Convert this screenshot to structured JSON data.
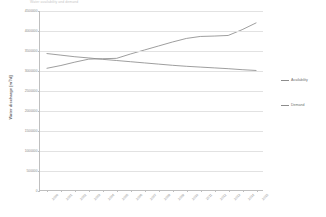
{
  "chart_data": {
    "type": "line",
    "title": "Water availability and demand",
    "xlabel": "",
    "ylabel": "Water discharge [m³/d]",
    "ylim": [
      0,
      4500000
    ],
    "ytick_values": [
      0,
      500000,
      1000000,
      1500000,
      2000000,
      2500000,
      3000000,
      3500000,
      4000000,
      4500000
    ],
    "ytick_labels": [
      "0",
      "500000",
      "1000000",
      "1500000",
      "2000000",
      "2500000",
      "3000000",
      "3500000",
      "4000000",
      "4500000"
    ],
    "grid": true,
    "legend_position": "right",
    "categories": [
      "2000",
      "2001",
      "2002",
      "2003",
      "2004",
      "2005",
      "2006",
      "2007",
      "2008",
      "2009",
      "2010",
      "2011",
      "2012",
      "2013",
      "2014",
      "2015"
    ],
    "series": [
      {
        "name": "Availability",
        "color": "#8c8c8c",
        "values": [
          3430000,
          3390000,
          3350000,
          3320000,
          3285000,
          3255000,
          3225000,
          3195000,
          3165000,
          3135000,
          3110000,
          3090000,
          3070000,
          3050000,
          3025000,
          3005000
        ]
      },
      {
        "name": "Demand",
        "color": "#8c8c8c",
        "values": [
          3060000,
          3130000,
          3215000,
          3290000,
          3300000,
          3310000,
          3420000,
          3520000,
          3620000,
          3720000,
          3810000,
          3860000,
          3870000,
          3885000,
          4030000,
          4200000
        ]
      }
    ]
  }
}
